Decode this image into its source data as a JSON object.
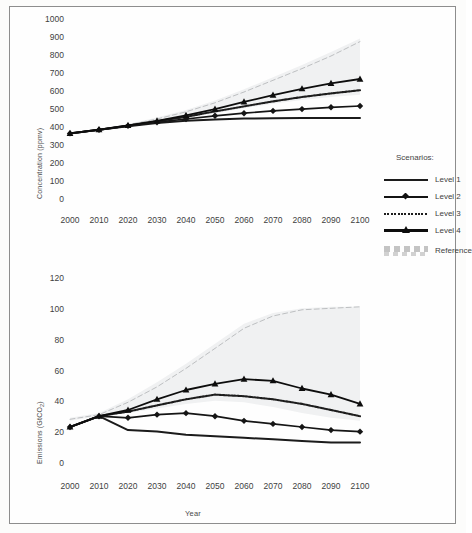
{
  "figure": {
    "legend_title": "Scenarios:",
    "x_axis_label": "Year"
  },
  "legend": {
    "items": [
      {
        "label": "Level 1",
        "key": "solid-thin-line"
      },
      {
        "label": "Level 2",
        "key": "line-with-diamond-markers"
      },
      {
        "label": "Level 3",
        "key": "dotted-line"
      },
      {
        "label": "Level 4",
        "key": "line-with-triangle-markers"
      },
      {
        "label": "Reference",
        "key": "faint-dashed-band"
      }
    ]
  },
  "chart_data": [
    {
      "type": "line",
      "id": "concentration-chart",
      "title": "",
      "xlabel": "Year",
      "ylabel": "Concentration (ppmv)",
      "xlim": [
        2000,
        2100
      ],
      "ylim": [
        0,
        1000
      ],
      "ytick_step": 100,
      "grid": false,
      "legend_position": "right",
      "x": [
        2000,
        2010,
        2020,
        2030,
        2040,
        2050,
        2060,
        2070,
        2080,
        2090,
        2100
      ],
      "yticks": [
        1000,
        900,
        800,
        700,
        600,
        500,
        400,
        300,
        200,
        100,
        0
      ],
      "xticks": [
        2000,
        2010,
        2020,
        2030,
        2040,
        2050,
        2060,
        2070,
        2080,
        2090,
        2100
      ],
      "series": [
        {
          "name": "Level 1",
          "values": [
            370,
            390,
            410,
            428,
            440,
            448,
            452,
            454,
            455,
            456,
            456
          ]
        },
        {
          "name": "Level 2",
          "values": [
            370,
            390,
            412,
            432,
            450,
            468,
            482,
            495,
            505,
            515,
            522
          ]
        },
        {
          "name": "Level 3",
          "values": [
            370,
            390,
            413,
            437,
            462,
            492,
            520,
            548,
            572,
            592,
            610
          ]
        },
        {
          "name": "Level 4",
          "values": [
            370,
            391,
            415,
            440,
            470,
            505,
            545,
            583,
            618,
            648,
            672
          ]
        },
        {
          "name": "Reference",
          "values": [
            370,
            392,
            418,
            450,
            490,
            540,
            600,
            665,
            730,
            800,
            880
          ]
        }
      ],
      "reference_band": {
        "upper": [
          372,
          395,
          422,
          458,
          500,
          552,
          615,
          682,
          750,
          822,
          898
        ],
        "lower": [
          368,
          388,
          408,
          430,
          455,
          482,
          510,
          535,
          556,
          572,
          585
        ]
      }
    },
    {
      "type": "line",
      "id": "emissions-chart",
      "title": "",
      "xlabel": "Year",
      "ylabel": "Emissions (GtCO2)",
      "xlim": [
        2000,
        2100
      ],
      "ylim": [
        0,
        120
      ],
      "ytick_step": 20,
      "grid": false,
      "legend_position": "none",
      "x": [
        2000,
        2010,
        2020,
        2030,
        2040,
        2050,
        2060,
        2070,
        2080,
        2090,
        2100
      ],
      "yticks": [
        120,
        100,
        80,
        60,
        40,
        20,
        0
      ],
      "xticks": [
        2000,
        2010,
        2020,
        2030,
        2040,
        2050,
        2060,
        2070,
        2080,
        2090,
        2100
      ],
      "series": [
        {
          "name": "Level 1",
          "values": [
            24,
            31,
            22,
            21,
            19,
            18,
            17,
            16,
            15,
            14,
            14
          ]
        },
        {
          "name": "Level 2",
          "values": [
            24,
            31,
            30,
            32,
            33,
            31,
            28,
            26,
            24,
            22,
            21
          ]
        },
        {
          "name": "Level 3",
          "values": [
            24,
            31,
            34,
            38,
            42,
            45,
            44,
            42,
            39,
            35,
            31
          ]
        },
        {
          "name": "Level 4",
          "values": [
            24,
            31,
            35,
            42,
            48,
            52,
            55,
            54,
            49,
            45,
            39
          ]
        },
        {
          "name": "Reference",
          "values": [
            29,
            32,
            40,
            50,
            62,
            75,
            88,
            96,
            100,
            101,
            102
          ]
        }
      ],
      "reference_band": {
        "upper": [
          30,
          33,
          42,
          53,
          65,
          78,
          91,
          98,
          101,
          102,
          102
        ],
        "lower": [
          28,
          31,
          33,
          36,
          39,
          41,
          40,
          37,
          33,
          30,
          28
        ]
      }
    }
  ]
}
